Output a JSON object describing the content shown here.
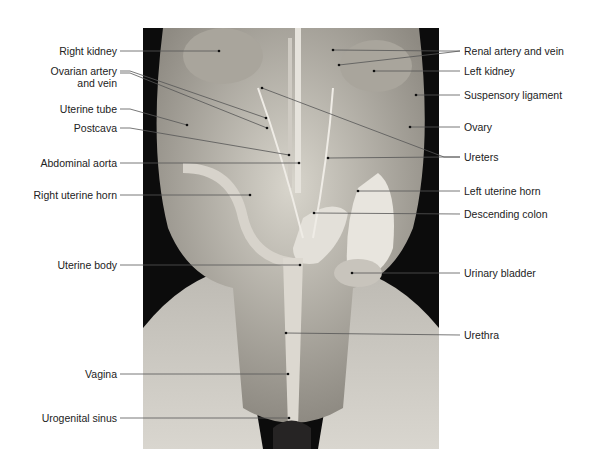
{
  "figure": {
    "left_labels": [
      {
        "id": "right-kidney",
        "text": "Right kidney",
        "x": 117,
        "y": 51
      },
      {
        "id": "ovarian-artery-vein-1",
        "text": "Ovarian artery",
        "x": 117,
        "y": 71
      },
      {
        "id": "ovarian-artery-vein-2",
        "text": "and vein",
        "x": 117,
        "y": 83
      },
      {
        "id": "uterine-tube",
        "text": "Uterine tube",
        "x": 117,
        "y": 109
      },
      {
        "id": "postcava",
        "text": "Postcava",
        "x": 117,
        "y": 128
      },
      {
        "id": "abdominal-aorta",
        "text": "Abdominal aorta",
        "x": 117,
        "y": 163
      },
      {
        "id": "right-uterine-horn",
        "text": "Right uterine horn",
        "x": 117,
        "y": 195
      },
      {
        "id": "uterine-body",
        "text": "Uterine body",
        "x": 117,
        "y": 265
      },
      {
        "id": "vagina",
        "text": "Vagina",
        "x": 117,
        "y": 374
      },
      {
        "id": "urogenital-sinus",
        "text": "Urogenital sinus",
        "x": 117,
        "y": 418
      }
    ],
    "right_labels": [
      {
        "id": "renal-artery-vein",
        "text": "Renal artery and vein",
        "x": 464,
        "y": 51
      },
      {
        "id": "left-kidney",
        "text": "Left kidney",
        "x": 464,
        "y": 71
      },
      {
        "id": "suspensory-ligament",
        "text": "Suspensory ligament",
        "x": 464,
        "y": 95
      },
      {
        "id": "ovary",
        "text": "Ovary",
        "x": 464,
        "y": 127
      },
      {
        "id": "ureters",
        "text": "Ureters",
        "x": 464,
        "y": 157
      },
      {
        "id": "left-uterine-horn",
        "text": "Left uterine horn",
        "x": 464,
        "y": 191
      },
      {
        "id": "descending-colon",
        "text": "Descending colon",
        "x": 464,
        "y": 214
      },
      {
        "id": "urinary-bladder",
        "text": "Urinary bladder",
        "x": 464,
        "y": 273
      },
      {
        "id": "urethra",
        "text": "Urethra",
        "x": 464,
        "y": 335
      }
    ]
  }
}
